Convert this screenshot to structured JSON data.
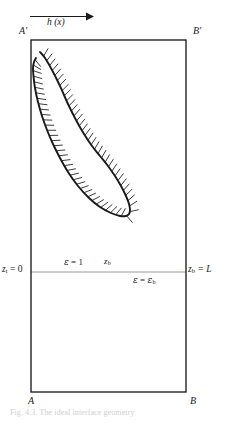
{
  "figure": {
    "domain": "diagram",
    "background_color": "#ffffff",
    "line_color": "#1a1a1a",
    "hatch_color": "#1a1a1a",
    "thin_line_color": "#8a8a8a"
  },
  "corners": {
    "top_left": "A′",
    "top_right": "B′",
    "bottom_left": "A",
    "bottom_right": "B"
  },
  "arrow": {
    "label": "h (x)",
    "direction": "right"
  },
  "axis_labels": {
    "left_z": "z",
    "left_z_sub": "t",
    "left_z_value": " = 0",
    "right_z": "z",
    "right_z_sub": "b",
    "right_z_value": " = L"
  },
  "regions": {
    "upper": {
      "symbol": "ε",
      "relation": " = 1"
    },
    "lower": {
      "symbol": "ε",
      "relation": " = ",
      "value_symbol": "ε",
      "value_sub": "b"
    }
  },
  "curve_marker": {
    "symbol": "z",
    "sub": "b"
  },
  "caption": {
    "text": "Fig. 4.3.  The ideal interface geometry"
  },
  "geometry": {
    "box": {
      "left": 31,
      "top": 40,
      "right": 186,
      "bottom": 392
    },
    "interface_line_y": 272,
    "arrow": {
      "x1": 30,
      "x2": 90,
      "y": 17
    },
    "curve_points": [
      [
        36,
        58
      ],
      [
        34,
        62
      ],
      [
        33,
        68
      ],
      [
        33.5,
        76
      ],
      [
        35,
        88
      ],
      [
        38,
        102
      ],
      [
        42,
        116
      ],
      [
        47,
        130
      ],
      [
        53,
        144
      ],
      [
        60,
        158
      ],
      [
        68,
        172
      ],
      [
        78,
        186
      ],
      [
        89,
        198
      ],
      [
        100,
        207
      ],
      [
        111,
        213
      ],
      [
        120,
        216
      ],
      [
        126,
        216
      ],
      [
        129,
        214
      ],
      [
        130,
        210
      ],
      [
        129,
        204
      ],
      [
        126,
        196
      ],
      [
        121,
        186
      ],
      [
        115,
        176
      ],
      [
        108,
        166
      ],
      [
        100,
        156
      ],
      [
        92,
        146
      ],
      [
        84,
        134
      ],
      [
        76,
        120
      ],
      [
        68,
        104
      ],
      [
        60,
        86
      ],
      [
        52,
        70
      ],
      [
        45,
        58
      ],
      [
        40,
        52
      ]
    ]
  }
}
